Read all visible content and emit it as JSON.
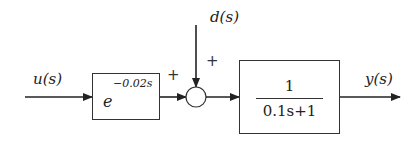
{
  "diagram": {
    "type": "block_diagram",
    "input": {
      "label": "u(s)"
    },
    "disturbance": {
      "label": "d(s)"
    },
    "output": {
      "label": "y(s)"
    },
    "delay_block": {
      "base": "e",
      "exponent": "−0.02s"
    },
    "summing_junction": {
      "signs": {
        "left": "+",
        "top": "+"
      }
    },
    "transfer_block": {
      "numerator": "1",
      "denominator": "0.1s+1"
    },
    "colors": {
      "stroke": "#333333",
      "text": "#222222",
      "background": "#ffffff"
    }
  }
}
